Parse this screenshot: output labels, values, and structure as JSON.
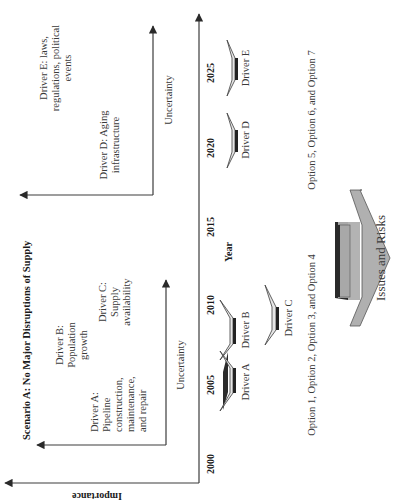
{
  "diagram": {
    "title": "Scenario A: No Major Disruptions of Supply",
    "orientation": "rotated 90 degrees counter-clockwise (text reads bottom-to-top)",
    "axes": {
      "outer_vertical_label": "Importance",
      "timeline_label": "Year",
      "inner_axis_label_1": "Uncertainty",
      "inner_axis_label_2": "Uncertainty"
    },
    "years": [
      "2000",
      "2005",
      "2010",
      "2015",
      "2020",
      "2025"
    ],
    "quadrant_1": {
      "drivers": [
        {
          "id": "A",
          "lines": [
            "Driver A:",
            "Pipeline",
            "construction,",
            "maintenance,",
            "and repair"
          ]
        },
        {
          "id": "B",
          "lines": [
            "Driver B:",
            "Population",
            "growth"
          ]
        },
        {
          "id": "C",
          "lines": [
            "Driver C:",
            "Supply",
            "availability"
          ]
        }
      ]
    },
    "quadrant_2": {
      "drivers": [
        {
          "id": "D",
          "lines": [
            "Driver D: Aging",
            "infrastructure"
          ]
        },
        {
          "id": "E",
          "lines": [
            "Driver E: laws,",
            "regulations, political",
            "events"
          ]
        }
      ]
    },
    "timeline_arrows": [
      {
        "label": "Driver A",
        "year": "2005"
      },
      {
        "label": "Driver B",
        "year": "2010"
      },
      {
        "label": "Driver C",
        "year": "2010"
      },
      {
        "label": "Driver D",
        "year": "2020"
      },
      {
        "label": "Driver E",
        "year": "2025"
      }
    ],
    "options": {
      "group_1": "Option 1, Option 2, Option 3,  and Option 4",
      "group_2": "Option  5, Option 6, and Option 7"
    },
    "issues_arrow": {
      "label": "Issues and Risks"
    },
    "colors": {
      "line": "#3c3c3c",
      "text": "#3a3a3a",
      "arrow_fill_light": "#e8e8e8",
      "arrow_fill_dark": "#a9a9a9",
      "arrow_shadow": "#2a2a2a"
    }
  }
}
